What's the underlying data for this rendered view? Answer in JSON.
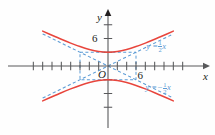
{
  "chart_data": {
    "type": "line",
    "title": "",
    "xlabel": "x",
    "ylabel": "y",
    "origin_label": "O",
    "grid": false,
    "legend": "annotations",
    "xlim": [
      -14,
      14
    ],
    "ylim": [
      -9.2,
      9.2
    ],
    "x_tick_labels": [
      "6"
    ],
    "y_tick_labels": [
      "6"
    ],
    "x_tick_label_value": 6,
    "y_tick_label_value": 6,
    "x_tick_step": 2,
    "y_tick_step": 3,
    "annotations": [
      {
        "name": "asymptote-positive",
        "text": "y = ½ x",
        "lhs": "y =",
        "sign": "",
        "num": "1",
        "den": "2",
        "var": "x",
        "color": "#5b9bd5",
        "x": 6.5,
        "y": 4.4
      },
      {
        "name": "asymptote-negative",
        "text": "y = -½ x",
        "lhs": "y =",
        "sign": "−",
        "num": "1",
        "den": "2",
        "var": "x",
        "color": "#5b9bd5",
        "x": 6.3,
        "y": -4.6
      }
    ],
    "series": [
      {
        "name": "hyperbola-upper-branch",
        "style": "solid",
        "color": "#e8453c",
        "equation": "y^2/9 - x^2/36 = 1 (upper)",
        "points": [
          {
            "x": -14,
            "y": 7.62
          },
          {
            "x": -12,
            "y": 6.71
          },
          {
            "x": -10,
            "y": 5.83
          },
          {
            "x": -8,
            "y": 5.0
          },
          {
            "x": -6,
            "y": 4.24
          },
          {
            "x": -4,
            "y": 3.61
          },
          {
            "x": -2,
            "y": 3.16
          },
          {
            "x": 0,
            "y": 3.0
          },
          {
            "x": 2,
            "y": 3.16
          },
          {
            "x": 4,
            "y": 3.61
          },
          {
            "x": 6,
            "y": 4.24
          },
          {
            "x": 8,
            "y": 5.0
          },
          {
            "x": 10,
            "y": 5.83
          },
          {
            "x": 12,
            "y": 6.71
          },
          {
            "x": 14,
            "y": 7.62
          }
        ]
      },
      {
        "name": "hyperbola-lower-branch",
        "style": "solid",
        "color": "#e8453c",
        "equation": "y^2/9 - x^2/36 = 1 (lower)",
        "points": [
          {
            "x": -14,
            "y": -7.62
          },
          {
            "x": -12,
            "y": -6.71
          },
          {
            "x": -10,
            "y": -5.83
          },
          {
            "x": -8,
            "y": -5.0
          },
          {
            "x": -6,
            "y": -4.24
          },
          {
            "x": -4,
            "y": -3.61
          },
          {
            "x": -2,
            "y": -3.16
          },
          {
            "x": 0,
            "y": -3.0
          },
          {
            "x": 2,
            "y": -3.16
          },
          {
            "x": 4,
            "y": -3.61
          },
          {
            "x": 6,
            "y": -4.24
          },
          {
            "x": 8,
            "y": -5.0
          },
          {
            "x": 10,
            "y": -5.83
          },
          {
            "x": 12,
            "y": -6.71
          },
          {
            "x": 14,
            "y": -7.62
          }
        ]
      },
      {
        "name": "asymptote-line-positive-slope",
        "style": "dashed",
        "color": "#5b9bd5",
        "equation": "y = (1/2)x",
        "points": [
          {
            "x": -14,
            "y": -7
          },
          {
            "x": 14,
            "y": 7
          }
        ]
      },
      {
        "name": "asymptote-line-negative-slope",
        "style": "dashed",
        "color": "#5b9bd5",
        "equation": "y = -(1/2)x",
        "points": [
          {
            "x": -14,
            "y": 7
          },
          {
            "x": 14,
            "y": -7
          }
        ]
      }
    ],
    "reference_box": {
      "name": "central-rectangle",
      "style": "dashed",
      "color": "#5b9bd5",
      "x_min": -6,
      "x_max": 6,
      "y_min": -3,
      "y_max": 3
    },
    "vertices": [
      {
        "x": 0,
        "y": 3
      },
      {
        "x": 0,
        "y": -3
      }
    ],
    "axes": {
      "x_axis_color": "#58595b",
      "y_axis_color": "#58595b",
      "arrowheads": [
        "x-positive",
        "y-positive"
      ]
    }
  }
}
